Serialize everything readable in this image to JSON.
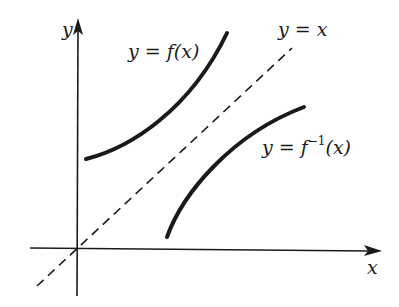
{
  "diagram": {
    "axes": {
      "x_label": "x",
      "y_label": "y"
    },
    "curves": [
      {
        "id": "f",
        "label_prefix": "y = f(x)",
        "style": "solid"
      },
      {
        "id": "identity",
        "label_prefix": "y = x",
        "style": "dashed"
      },
      {
        "id": "f_inverse",
        "label_prefix": "y = f",
        "label_sup": "−1",
        "label_suffix": "(x)",
        "style": "solid"
      }
    ],
    "colors": {
      "stroke": "#1a1a1a",
      "background": "#ffffff"
    }
  }
}
